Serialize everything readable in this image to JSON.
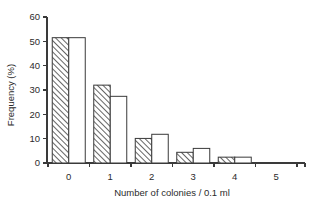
{
  "chart_data": {
    "type": "bar",
    "title": "",
    "subtitle": "",
    "xlabel": "Number of colonies / 0.1 ml",
    "ylabel": "Frequency (%)",
    "categories": [
      "0",
      "1",
      "2",
      "3",
      "4",
      "5"
    ],
    "series": [
      {
        "name": "observed",
        "style": "hatched",
        "values": [
          51.5,
          32.0,
          10.1,
          4.4,
          2.4,
          0
        ]
      },
      {
        "name": "expected",
        "style": "open",
        "values": [
          51.5,
          27.4,
          11.8,
          6.0,
          2.4,
          0
        ]
      }
    ],
    "ylim": [
      0,
      60
    ],
    "yticks": [
      0,
      10,
      20,
      30,
      40,
      50,
      60
    ],
    "ytick_labels": [
      "0",
      "10",
      "20",
      "30",
      "40",
      "50",
      "60"
    ],
    "xtick_labels": [
      "0",
      "1",
      "2",
      "3",
      "4",
      "5"
    ],
    "grid": false,
    "legend": "none",
    "colors": {
      "axis": "#3a3a3a",
      "bar_edge": "#3a3a3a",
      "bar_open_fill": "#ffffff",
      "hatch": "#4a4a4a",
      "background": "#ffffff",
      "text": "#2b2b2b"
    }
  }
}
